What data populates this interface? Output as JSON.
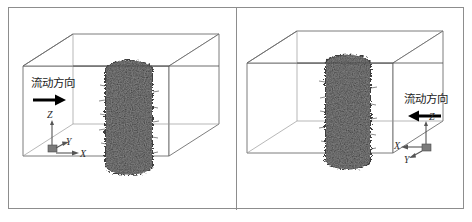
{
  "figure": {
    "type": "3d-simulation-domain-schematic",
    "panel_count": 2,
    "colors": {
      "frame_border": "#8d8d8d",
      "box_wireframe": "#6e6e6e",
      "cylinder": "#3c3c3c",
      "arrow": "#000000",
      "axis": "#555555",
      "background": "#ffffff"
    }
  },
  "panels": [
    {
      "id": "left",
      "flow_label": "流动方向",
      "flow_direction": "right",
      "arrow_icon": "arrow-right-icon",
      "axes": {
        "z_label": "Z",
        "y_label": "Y",
        "x_label": "X",
        "origin_position": "bottom-left"
      },
      "object": {
        "name": "cylinder",
        "description": "textured vertical cylinder"
      }
    },
    {
      "id": "right",
      "flow_label": "流动方向",
      "flow_direction": "left",
      "arrow_icon": "arrow-left-icon",
      "axes": {
        "z_label": "Z",
        "y_label": "Y",
        "x_label": "X",
        "origin_position": "bottom-right"
      },
      "object": {
        "name": "cylinder",
        "description": "textured vertical cylinder"
      }
    }
  ]
}
